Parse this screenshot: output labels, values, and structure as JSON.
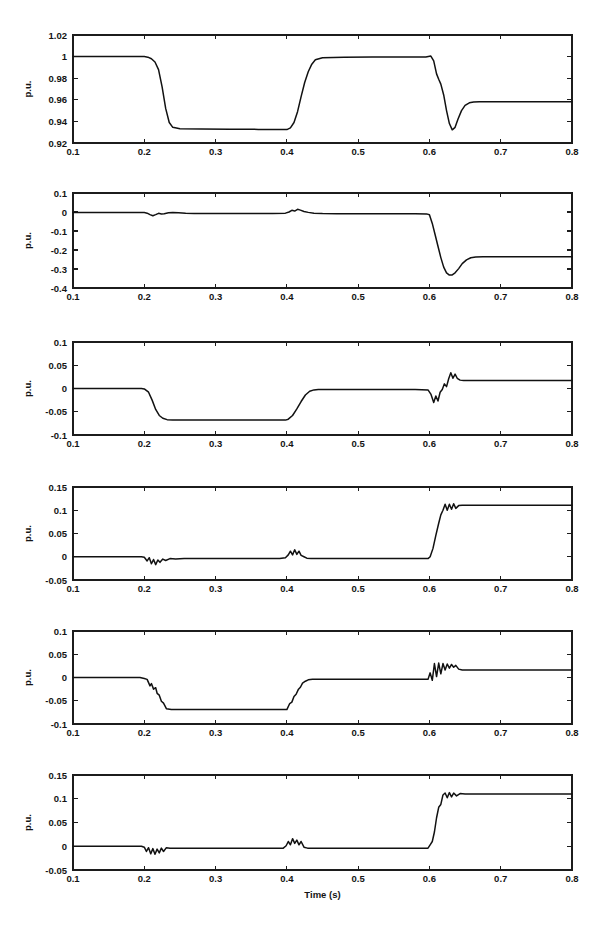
{
  "figure": {
    "width": 607,
    "height": 948,
    "background": "#ffffff",
    "trace_color": "#111111",
    "axis_color": "#1c1c1c",
    "xlabel": "Time (s)",
    "ylabel": "p.u.",
    "x_ticks": [
      "0.1",
      "0.2",
      "0.3",
      "0.4",
      "0.5",
      "0.6",
      "0.7",
      "0.8"
    ],
    "x_tick_values": [
      0.1,
      0.2,
      0.3,
      0.4,
      0.5,
      0.6,
      0.7,
      0.8
    ],
    "xlim": [
      0.1,
      0.8
    ]
  },
  "chart_data": [
    {
      "type": "line",
      "panel_index": 1,
      "title": "",
      "xlabel": "",
      "ylabel": "p.u.",
      "xlim": [
        0.1,
        0.8
      ],
      "ylim": [
        0.92,
        1.02
      ],
      "y_ticks": [
        0.92,
        0.94,
        0.96,
        0.98,
        1,
        1.02
      ],
      "y_tick_labels": [
        "0.92",
        "0.94",
        "0.96",
        "0.98",
        "1",
        "1.02"
      ],
      "grid": false,
      "legend": "none",
      "series": [
        {
          "name": "voltage",
          "x": [
            0.1,
            0.15,
            0.195,
            0.2,
            0.205,
            0.21,
            0.215,
            0.22,
            0.225,
            0.23,
            0.235,
            0.24,
            0.25,
            0.28,
            0.32,
            0.36,
            0.395,
            0.4,
            0.405,
            0.41,
            0.415,
            0.42,
            0.425,
            0.43,
            0.435,
            0.44,
            0.45,
            0.48,
            0.52,
            0.56,
            0.595,
            0.602,
            0.606,
            0.61,
            0.613,
            0.616,
            0.62,
            0.624,
            0.628,
            0.632,
            0.636,
            0.64,
            0.645,
            0.65,
            0.656,
            0.662,
            0.67,
            0.69,
            0.72,
            0.76,
            0.8
          ],
          "y": [
            1.0,
            1.0,
            1.0,
            1.0,
            0.9995,
            0.998,
            0.995,
            0.988,
            0.972,
            0.952,
            0.939,
            0.9345,
            0.9332,
            0.933,
            0.9328,
            0.9326,
            0.9324,
            0.9324,
            0.934,
            0.939,
            0.949,
            0.963,
            0.976,
            0.986,
            0.993,
            0.997,
            0.999,
            0.9995,
            0.9997,
            0.9997,
            0.9997,
            1.0005,
            0.996,
            0.984,
            0.979,
            0.9745,
            0.9645,
            0.95,
            0.938,
            0.9322,
            0.9345,
            0.942,
            0.95,
            0.9548,
            0.9572,
            0.958,
            0.9581,
            0.9581,
            0.9581,
            0.9581,
            0.9581
          ]
        }
      ]
    },
    {
      "type": "line",
      "panel_index": 2,
      "title": "",
      "xlabel": "",
      "ylabel": "p.u.",
      "xlim": [
        0.1,
        0.8
      ],
      "ylim": [
        -0.4,
        0.1
      ],
      "y_ticks": [
        -0.4,
        -0.3,
        -0.2,
        -0.1,
        0,
        0.1
      ],
      "y_tick_labels": [
        "-0.4",
        "-0.3",
        "-0.2",
        "-0.1",
        "0",
        "0.1"
      ],
      "grid": false,
      "legend": "none",
      "series": [
        {
          "name": "reactive-power",
          "x": [
            0.1,
            0.15,
            0.195,
            0.2,
            0.204,
            0.208,
            0.212,
            0.216,
            0.22,
            0.224,
            0.228,
            0.234,
            0.24,
            0.248,
            0.258,
            0.27,
            0.3,
            0.34,
            0.38,
            0.398,
            0.403,
            0.407,
            0.411,
            0.415,
            0.419,
            0.424,
            0.43,
            0.438,
            0.45,
            0.47,
            0.5,
            0.54,
            0.58,
            0.596,
            0.6,
            0.604,
            0.608,
            0.612,
            0.616,
            0.62,
            0.624,
            0.628,
            0.632,
            0.636,
            0.641,
            0.646,
            0.652,
            0.658,
            0.665,
            0.675,
            0.69,
            0.72,
            0.76,
            0.8
          ],
          "y": [
            -0.002,
            -0.002,
            -0.002,
            -0.003,
            -0.006,
            -0.014,
            -0.02,
            -0.014,
            -0.007,
            -0.01,
            -0.009,
            -0.004,
            -0.002,
            -0.004,
            -0.007,
            -0.008,
            -0.008,
            -0.008,
            -0.008,
            -0.006,
            0.0,
            0.009,
            0.005,
            0.014,
            0.01,
            0.003,
            -0.002,
            -0.006,
            -0.008,
            -0.009,
            -0.009,
            -0.009,
            -0.009,
            -0.01,
            -0.014,
            -0.06,
            -0.12,
            -0.18,
            -0.24,
            -0.29,
            -0.32,
            -0.332,
            -0.331,
            -0.32,
            -0.298,
            -0.272,
            -0.252,
            -0.241,
            -0.237,
            -0.236,
            -0.236,
            -0.236,
            -0.236,
            -0.236
          ]
        }
      ]
    },
    {
      "type": "line",
      "panel_index": 3,
      "title": "",
      "xlabel": "",
      "ylabel": "p.u.",
      "xlim": [
        0.1,
        0.8
      ],
      "ylim": [
        -0.1,
        0.1
      ],
      "y_ticks": [
        -0.1,
        -0.05,
        0,
        0.05,
        0.1
      ],
      "y_tick_labels": [
        "-0.1",
        "-0.05",
        "0",
        "0.05",
        "0.1"
      ],
      "grid": false,
      "legend": "none",
      "series": [
        {
          "name": "signal-3",
          "x": [
            0.1,
            0.15,
            0.196,
            0.2,
            0.206,
            0.211,
            0.216,
            0.221,
            0.226,
            0.232,
            0.24,
            0.25,
            0.27,
            0.3,
            0.34,
            0.38,
            0.398,
            0.402,
            0.408,
            0.414,
            0.42,
            0.426,
            0.432,
            0.438,
            0.444,
            0.452,
            0.47,
            0.5,
            0.54,
            0.58,
            0.598,
            0.602,
            0.606,
            0.609,
            0.612,
            0.615,
            0.618,
            0.621,
            0.624,
            0.627,
            0.63,
            0.633,
            0.636,
            0.639,
            0.643,
            0.648,
            0.654,
            0.662,
            0.68,
            0.71,
            0.75,
            0.8
          ],
          "y": [
            0.0,
            0.0,
            0.0,
            -0.001,
            -0.008,
            -0.025,
            -0.045,
            -0.058,
            -0.064,
            -0.067,
            -0.068,
            -0.068,
            -0.068,
            -0.068,
            -0.068,
            -0.068,
            -0.068,
            -0.066,
            -0.058,
            -0.044,
            -0.028,
            -0.014,
            -0.006,
            -0.003,
            -0.002,
            -0.002,
            -0.002,
            -0.002,
            -0.002,
            -0.002,
            -0.003,
            -0.012,
            -0.03,
            -0.016,
            -0.027,
            -0.008,
            -0.002,
            0.01,
            0.004,
            0.021,
            0.034,
            0.022,
            0.031,
            0.022,
            0.018,
            0.017,
            0.017,
            0.017,
            0.017,
            0.017,
            0.017,
            0.017
          ]
        }
      ]
    },
    {
      "type": "line",
      "panel_index": 4,
      "title": "",
      "xlabel": "",
      "ylabel": "p.u.",
      "xlim": [
        0.1,
        0.8
      ],
      "ylim": [
        -0.05,
        0.15
      ],
      "y_ticks": [
        -0.05,
        0,
        0.05,
        0.1,
        0.15
      ],
      "y_tick_labels": [
        "-0.05",
        "0",
        "0.05",
        "0.1",
        "0.15"
      ],
      "grid": false,
      "legend": "none",
      "series": [
        {
          "name": "signal-4",
          "x": [
            0.1,
            0.15,
            0.196,
            0.2,
            0.204,
            0.207,
            0.21,
            0.213,
            0.216,
            0.219,
            0.222,
            0.226,
            0.23,
            0.236,
            0.244,
            0.256,
            0.275,
            0.31,
            0.35,
            0.39,
            0.398,
            0.402,
            0.405,
            0.408,
            0.411,
            0.414,
            0.417,
            0.42,
            0.424,
            0.428,
            0.434,
            0.444,
            0.465,
            0.5,
            0.545,
            0.585,
            0.598,
            0.601,
            0.605,
            0.609,
            0.613,
            0.616,
            0.619,
            0.622,
            0.625,
            0.628,
            0.631,
            0.634,
            0.637,
            0.641,
            0.646,
            0.652,
            0.662,
            0.68,
            0.71,
            0.75,
            0.8
          ],
          "y": [
            0.0,
            0.0,
            0.0,
            -0.001,
            -0.009,
            -0.002,
            -0.015,
            -0.006,
            -0.017,
            -0.007,
            -0.012,
            -0.005,
            -0.008,
            -0.004,
            -0.005,
            -0.004,
            -0.004,
            -0.004,
            -0.004,
            -0.004,
            -0.002,
            0.004,
            0.012,
            0.004,
            0.015,
            0.005,
            0.012,
            0.003,
            0.0,
            -0.003,
            -0.004,
            -0.004,
            -0.004,
            -0.004,
            -0.004,
            -0.004,
            -0.004,
            0.0,
            0.018,
            0.046,
            0.072,
            0.09,
            0.1,
            0.113,
            0.1,
            0.113,
            0.102,
            0.114,
            0.104,
            0.11,
            0.111,
            0.111,
            0.111,
            0.111,
            0.111,
            0.111,
            0.111
          ]
        }
      ]
    },
    {
      "type": "line",
      "panel_index": 5,
      "title": "",
      "xlabel": "",
      "ylabel": "p.u.",
      "xlim": [
        0.1,
        0.8
      ],
      "ylim": [
        -0.1,
        0.1
      ],
      "y_ticks": [
        -0.1,
        -0.05,
        0,
        0.05,
        0.1
      ],
      "y_tick_labels": [
        "-0.1",
        "-0.05",
        "0",
        "0.05",
        "0.1"
      ],
      "grid": false,
      "legend": "none",
      "series": [
        {
          "name": "signal-5",
          "x": [
            0.1,
            0.15,
            0.194,
            0.2,
            0.204,
            0.208,
            0.21,
            0.213,
            0.216,
            0.218,
            0.221,
            0.224,
            0.227,
            0.231,
            0.238,
            0.25,
            0.275,
            0.31,
            0.35,
            0.39,
            0.4,
            0.404,
            0.407,
            0.41,
            0.413,
            0.416,
            0.419,
            0.422,
            0.426,
            0.43,
            0.436,
            0.446,
            0.465,
            0.5,
            0.545,
            0.585,
            0.598,
            0.601,
            0.604,
            0.607,
            0.61,
            0.613,
            0.616,
            0.619,
            0.622,
            0.625,
            0.628,
            0.631,
            0.634,
            0.637,
            0.641,
            0.646,
            0.653,
            0.665,
            0.69,
            0.73,
            0.8
          ],
          "y": [
            0.0,
            0.0,
            0.0,
            -0.002,
            -0.004,
            -0.018,
            -0.013,
            -0.025,
            -0.022,
            -0.034,
            -0.038,
            -0.051,
            -0.055,
            -0.067,
            -0.069,
            -0.069,
            -0.069,
            -0.069,
            -0.069,
            -0.069,
            -0.069,
            -0.056,
            -0.053,
            -0.041,
            -0.036,
            -0.026,
            -0.021,
            -0.012,
            -0.008,
            -0.005,
            -0.004,
            -0.004,
            -0.004,
            -0.004,
            -0.004,
            -0.004,
            -0.004,
            0.01,
            -0.006,
            0.03,
            0.002,
            0.031,
            0.008,
            0.03,
            0.016,
            0.029,
            0.02,
            0.028,
            0.022,
            0.026,
            0.018,
            0.016,
            0.016,
            0.016,
            0.016,
            0.016,
            0.016
          ]
        }
      ]
    },
    {
      "type": "line",
      "panel_index": 6,
      "title": "",
      "xlabel": "Time (s)",
      "ylabel": "p.u.",
      "xlim": [
        0.1,
        0.8
      ],
      "ylim": [
        -0.05,
        0.15
      ],
      "y_ticks": [
        -0.05,
        0,
        0.05,
        0.1,
        0.15
      ],
      "y_tick_labels": [
        "-0.05",
        "0",
        "0.05",
        "0.1",
        "0.15"
      ],
      "grid": false,
      "legend": "none",
      "series": [
        {
          "name": "signal-6",
          "x": [
            0.1,
            0.15,
            0.196,
            0.2,
            0.203,
            0.206,
            0.209,
            0.212,
            0.215,
            0.218,
            0.221,
            0.224,
            0.227,
            0.231,
            0.236,
            0.244,
            0.258,
            0.285,
            0.32,
            0.36,
            0.395,
            0.399,
            0.402,
            0.405,
            0.408,
            0.411,
            0.414,
            0.417,
            0.42,
            0.424,
            0.429,
            0.438,
            0.455,
            0.49,
            0.54,
            0.585,
            0.598,
            0.601,
            0.604,
            0.607,
            0.61,
            0.613,
            0.616,
            0.619,
            0.622,
            0.625,
            0.628,
            0.631,
            0.634,
            0.638,
            0.643,
            0.65,
            0.662,
            0.685,
            0.72,
            0.76,
            0.8
          ],
          "y": [
            0.0,
            0.0,
            0.0,
            -0.002,
            -0.011,
            -0.003,
            -0.016,
            -0.005,
            -0.017,
            -0.006,
            -0.014,
            -0.004,
            -0.011,
            -0.003,
            -0.004,
            -0.004,
            -0.004,
            -0.004,
            -0.004,
            -0.004,
            -0.004,
            0.001,
            0.01,
            0.003,
            0.016,
            0.006,
            0.013,
            0.003,
            0.01,
            -0.002,
            -0.004,
            -0.004,
            -0.004,
            -0.004,
            -0.004,
            -0.004,
            -0.004,
            0.003,
            0.01,
            0.03,
            0.06,
            0.082,
            0.088,
            0.108,
            0.112,
            0.102,
            0.113,
            0.104,
            0.112,
            0.106,
            0.111,
            0.11,
            0.11,
            0.11,
            0.11,
            0.11,
            0.11
          ]
        }
      ]
    }
  ]
}
